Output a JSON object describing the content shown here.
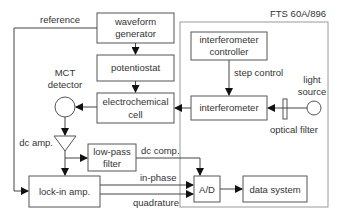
{
  "diagram": {
    "enclosure": {
      "label": "FTS 60A/896"
    },
    "blocks": {
      "waveform_generator": {
        "line1": "waveform",
        "line2": "generator"
      },
      "potentiostat": {
        "label": "potentiostat"
      },
      "electrochemical_cell": {
        "line1": "electrochemical",
        "line2": "cell"
      },
      "interferometer_controller": {
        "line1": "interferometer",
        "line2": "controller"
      },
      "interferometer": {
        "label": "interferometer"
      },
      "low_pass_filter": {
        "line1": "low-pass",
        "line2": "filter"
      },
      "lock_in_amp": {
        "label": "lock-in amp."
      },
      "ad_converter": {
        "label": "A/D"
      },
      "data_system": {
        "label": "data system"
      }
    },
    "components": {
      "mct_detector": {
        "line1": "MCT",
        "line2": "detector"
      },
      "dc_amp": {
        "label": "dc amp."
      },
      "light_source": {
        "line1": "light",
        "line2": "source"
      },
      "optical_filter": {
        "label": "optical filter"
      }
    },
    "signals": {
      "reference": "reference",
      "step_control": "step control",
      "dc_comp": "dc comp.",
      "in_phase": "in-phase",
      "quadrature": "quadrature"
    }
  }
}
